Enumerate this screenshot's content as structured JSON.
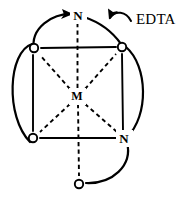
{
  "figure": {
    "background_color": "#ffffff",
    "line_color": "#000000",
    "width": 181,
    "height": 198
  },
  "annotations": {
    "edta_label": "EDTA",
    "edta_arrow_icon": "curved-arrow-left-icon"
  },
  "atoms": {
    "center": {
      "label": "M",
      "name": "metal-center",
      "x": 77,
      "y": 96
    },
    "nitrogen_top": {
      "label": "N",
      "name": "nitrogen-top",
      "x": 78,
      "y": 15
    },
    "nitrogen_bottom_right": {
      "label": "N",
      "name": "nitrogen-bottom-right",
      "x": 124,
      "y": 138
    },
    "oxygen_top_left": {
      "label": "O",
      "name": "oxygen-top-left",
      "x": 34,
      "y": 48
    },
    "oxygen_top_right": {
      "label": "O",
      "name": "oxygen-top-right",
      "x": 122,
      "y": 47
    },
    "oxygen_bottom_left": {
      "label": "O",
      "name": "oxygen-bottom-left",
      "x": 33,
      "y": 138
    },
    "oxygen_bottom": {
      "label": "O",
      "name": "oxygen-bottom",
      "x": 79,
      "y": 184
    }
  },
  "bonds": {
    "solid_edges": [
      "oxygen-top-left to oxygen-top-right",
      "oxygen-top-left to oxygen-bottom-left",
      "oxygen-bottom-left to nitrogen-bottom-right",
      "oxygen-top-right to nitrogen-bottom-right"
    ],
    "dashed_coordination": [
      "metal-center to nitrogen-top",
      "metal-center to oxygen-bottom",
      "metal-center to oxygen-top-left",
      "metal-center to oxygen-top-right",
      "metal-center to oxygen-bottom-left",
      "metal-center to nitrogen-bottom-right"
    ]
  },
  "chelate_arcs": [
    "nitrogen-top to oxygen-top-left",
    "nitrogen-top to oxygen-top-right",
    "oxygen-top-left to oxygen-bottom-left (outer left arc)",
    "oxygen-top-right to nitrogen-bottom-right (outer right arc)",
    "nitrogen-bottom-right to oxygen-bottom (outer bottom arc)"
  ]
}
